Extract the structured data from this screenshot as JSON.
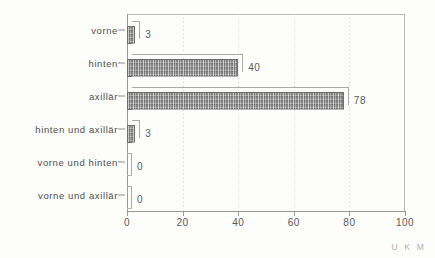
{
  "chart_data": {
    "type": "bar",
    "orientation": "horizontal",
    "title": "",
    "subtitle": "",
    "xlabel": "",
    "ylabel": "",
    "categories": [
      "vorne",
      "hinten",
      "axillär",
      "hinten und axillär",
      "vorne und hinten",
      "vorne und axillär"
    ],
    "values": [
      3,
      40,
      78,
      3,
      0,
      0
    ],
    "value_labels": [
      "3",
      "40",
      "78",
      "3",
      "0",
      "0"
    ],
    "xlim": [
      0,
      100
    ],
    "xticks": [
      0,
      20,
      40,
      60,
      80,
      100
    ],
    "xtick_labels": [
      "0",
      "20",
      "40",
      "60",
      "80",
      "100"
    ],
    "grid": "vertical-dotted",
    "legend": "none",
    "bar_style": "3d-extruded-hatched-gray",
    "colors": {
      "bar_fill": "#8f8f8f",
      "bar_outline": "#6e6e6e",
      "bar_extrusion": "#eeeeee",
      "axis": "#9a9a9a",
      "gridline": "#d2d2d2",
      "text": "#4f4f4f",
      "background": "#fdfdfc",
      "watermark": "#b0b0b0"
    }
  },
  "annotations": {
    "watermark": "U K M"
  }
}
